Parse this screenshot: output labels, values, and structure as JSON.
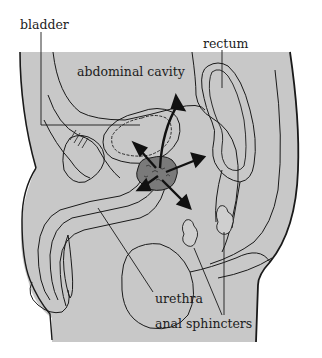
{
  "figure": {
    "type": "anatomical-cross-section",
    "colors": {
      "background": "#ffffff",
      "body_fill": "#c8c8c8",
      "outline": "#1a1a1a",
      "prostate_fill": "#7a7a7a",
      "arrow": "#111111"
    }
  },
  "labels": {
    "bladder": "bladder",
    "rectum": "rectum",
    "abdominal_cavity": "abdominal cavity",
    "urethra": "urethra",
    "anal_sphincters": "anal sphincters"
  },
  "arrows": {
    "count": 5,
    "origin": "prostate",
    "directions": [
      "up",
      "upper-left",
      "right",
      "lower-left",
      "lower-right"
    ]
  }
}
